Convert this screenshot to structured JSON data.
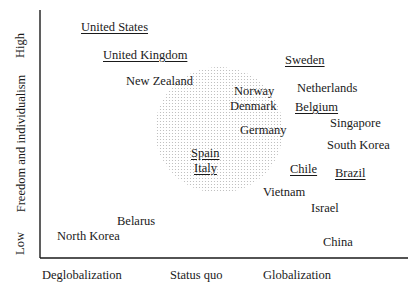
{
  "axes": {
    "y_title": "Freedom and individualism",
    "y_low": "Low",
    "y_high": "High",
    "x_ticks": [
      "Deglobalization",
      "Status quo",
      "Globalization"
    ]
  },
  "countries": [
    {
      "name": "United States",
      "underlined": true
    },
    {
      "name": "United Kingdom",
      "underlined": true
    },
    {
      "name": "New Zealand",
      "underlined": false
    },
    {
      "name": "Sweden",
      "underlined": true
    },
    {
      "name": "Norway",
      "underlined": false
    },
    {
      "name": "Denmark",
      "underlined": false
    },
    {
      "name": "Netherlands",
      "underlined": false
    },
    {
      "name": "Belgium",
      "underlined": true
    },
    {
      "name": "Germany",
      "underlined": false
    },
    {
      "name": "Singapore",
      "underlined": false
    },
    {
      "name": "South Korea",
      "underlined": false
    },
    {
      "name": "Spain",
      "underlined": true
    },
    {
      "name": "Italy",
      "underlined": true
    },
    {
      "name": "Chile",
      "underlined": true
    },
    {
      "name": "Brazil",
      "underlined": true
    },
    {
      "name": "Vietnam",
      "underlined": false
    },
    {
      "name": "Israel",
      "underlined": false
    },
    {
      "name": "Belarus",
      "underlined": false
    },
    {
      "name": "North Korea",
      "underlined": false
    },
    {
      "name": "China",
      "underlined": false
    }
  ],
  "colors": {
    "axis": "#1a1a1a",
    "shade_dot": "#b8b8b8"
  }
}
